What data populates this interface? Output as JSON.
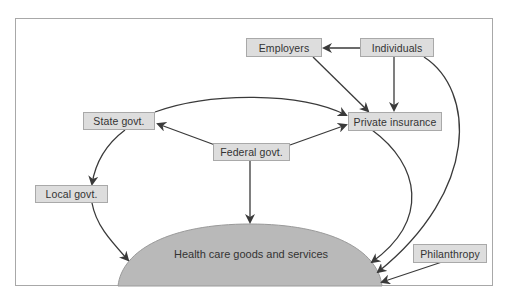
{
  "diagram": {
    "nodes": {
      "employers": "Employers",
      "individuals": "Individuals",
      "private_insurance": "Private insurance",
      "state_govt": "State govt.",
      "federal_govt": "Federal govt.",
      "local_govt": "Local govt.",
      "philanthropy": "Philanthropy",
      "health_care": "Health care goods and services"
    },
    "edges": [
      {
        "from": "Individuals",
        "to": "Employers"
      },
      {
        "from": "Individuals",
        "to": "Private insurance"
      },
      {
        "from": "Employers",
        "to": "Private insurance"
      },
      {
        "from": "State govt.",
        "to": "Private insurance"
      },
      {
        "from": "Federal govt.",
        "to": "Private insurance"
      },
      {
        "from": "Federal govt.",
        "to": "State govt."
      },
      {
        "from": "Federal govt.",
        "to": "Health care goods and services"
      },
      {
        "from": "State govt.",
        "to": "Local govt."
      },
      {
        "from": "Local govt.",
        "to": "Health care goods and services"
      },
      {
        "from": "Private insurance",
        "to": "Health care goods and services"
      },
      {
        "from": "Individuals",
        "to": "Health care goods and services"
      },
      {
        "from": "Philanthropy",
        "to": "Health care goods and services"
      }
    ],
    "colors": {
      "box_fill": "#dddddd",
      "box_border": "#a9a9a9",
      "dome_fill": "#b9b9b9",
      "arrow": "#3a3a3a",
      "frame": "#a8a8a8"
    }
  }
}
